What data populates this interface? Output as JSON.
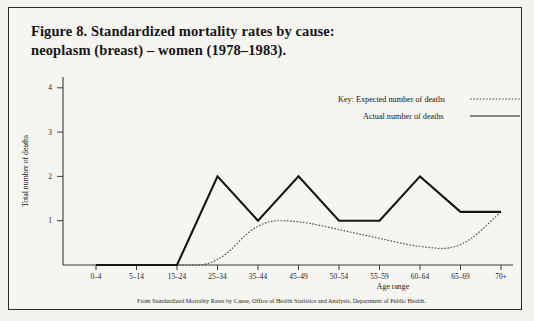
{
  "figure": {
    "title_line1": "Figure 8. Standardized mortality rates by cause:",
    "title_line2": "neoplasm (breast) – women (1978–1983).",
    "source_note": "From Standardized Mortality Rates by Cause, Office of Health Statistics and Analysis, Department of Public Health."
  },
  "legend": {
    "expected_label": "Key: Expected number of deaths",
    "actual_label": "Actual number of deaths"
  },
  "axes": {
    "y_title": "Total number of deaths",
    "x_title": "Age range",
    "y_ticks": [
      "1",
      "2",
      "3",
      "4"
    ]
  },
  "colors": {
    "actual_line": "#141414",
    "expected_line": "#4a4a4a",
    "axis": "#3a3a3a",
    "background": "#f7f5f1",
    "border": "#2b2b2b"
  },
  "chart_data": {
    "type": "line",
    "title": "Figure 8. Standardized mortality rates by cause: neoplasm (breast) – women (1978–1983).",
    "xlabel": "Age range",
    "ylabel": "Total number of deaths",
    "ylim": [
      0,
      4.4
    ],
    "yticks": [
      1,
      2,
      3,
      4
    ],
    "grid": false,
    "legend_position": "top-right",
    "categories": [
      "0–4",
      "5–14",
      "15–24",
      "25–34",
      "35–44",
      "45–49",
      "50–54",
      "55–59",
      "60–64",
      "65–69",
      "70+"
    ],
    "series": [
      {
        "name": "Actual number of deaths",
        "style": "solid",
        "values": [
          0,
          0,
          0,
          2,
          1,
          2,
          1,
          1,
          2,
          1.2,
          1.2
        ]
      },
      {
        "name": "Expected number of deaths",
        "style": "dotted",
        "values": [
          0,
          0,
          0,
          0,
          1,
          1,
          0.8,
          0.6,
          0.4,
          0.35,
          1.2
        ]
      }
    ]
  }
}
